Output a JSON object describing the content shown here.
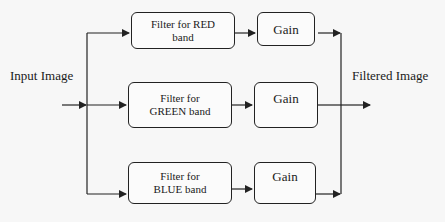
{
  "diagram": {
    "type": "block-diagram",
    "input_label": "Input Image",
    "output_label": "Filtered Image",
    "branches": [
      {
        "filter_line1": "Filter for RED",
        "filter_line2": "band",
        "gain_label": "Gain",
        "color": "red"
      },
      {
        "filter_line1": "Filter for",
        "filter_line2": "GREEN band",
        "gain_label": "Gain",
        "color": "green"
      },
      {
        "filter_line1": "Filter for",
        "filter_line2": "BLUE band",
        "gain_label": "Gain",
        "color": "blue"
      }
    ],
    "colors": {
      "stroke": "#222222",
      "background": "#f7f7f7",
      "text": "#1a1a1a"
    }
  }
}
